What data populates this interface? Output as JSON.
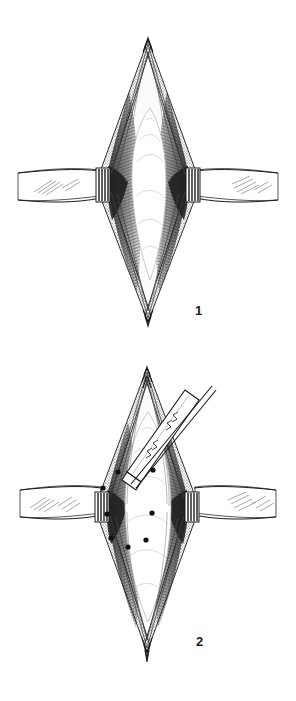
{
  "document": {
    "kind": "surgical-technique-illustration",
    "style": "pen-and-ink line drawing",
    "background_color": "#ffffff",
    "ink_color": "#1a1a1a",
    "panel_count": 2
  },
  "panels": [
    {
      "id": "panel-1",
      "number_label": "1",
      "caption": "",
      "description": "Diamond-shaped surgical exposure, wound edges retracted, deep layers shown without instrument",
      "features": {
        "skin_flap_left": "skin-flap-left",
        "skin_flap_right": "skin-flap-right",
        "wound_margin": "cut-skin-edge-stippled",
        "muscle_layer_left": "hatched-muscle-left",
        "muscle_layer_right": "hatched-muscle-right",
        "deep_field": "exposed-deep-tissue",
        "retractor_blade_left": "retractor-blade-left",
        "retractor_blade_right": "retractor-blade-right"
      }
    },
    {
      "id": "panel-2",
      "number_label": "2",
      "caption": "",
      "description": "Same exposure with surgical instrument introduced from upper right and marked points on the deep tissue surface",
      "features": {
        "instrument": "surgical-elevator-instrument",
        "instrument_entry": "upper-right",
        "marker_dots_count": 8
      },
      "marker_points": [
        {
          "x": 118,
          "y": 472
        },
        {
          "x": 103,
          "y": 488
        },
        {
          "x": 153,
          "y": 470
        },
        {
          "x": 107,
          "y": 514
        },
        {
          "x": 152,
          "y": 513
        },
        {
          "x": 111,
          "y": 538
        },
        {
          "x": 146,
          "y": 540
        },
        {
          "x": 128,
          "y": 547
        }
      ]
    }
  ],
  "colors": {
    "ink": "#1a1a1a",
    "ink_mid": "#555555",
    "ink_light": "#9a9a9a",
    "paper": "#ffffff",
    "shadow_fill": "#3d3d3d",
    "muscle_fill": "#6e6e6e",
    "tissue_fill": "#fafafa"
  }
}
